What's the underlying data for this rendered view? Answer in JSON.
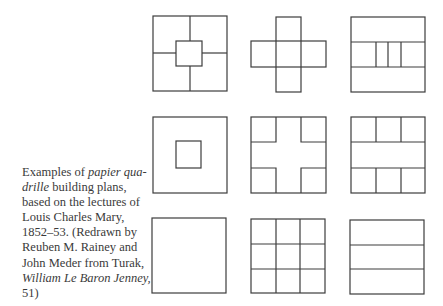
{
  "caption": {
    "lines": [
      {
        "pre": "Examples of ",
        "ital": "papier qua-",
        "post": ""
      },
      {
        "pre": "",
        "ital": "drille",
        "post": " building plans,"
      },
      {
        "pre": "based on the lectures of",
        "ital": "",
        "post": ""
      },
      {
        "pre": "Louis Charles Mary,",
        "ital": "",
        "post": ""
      },
      {
        "pre": "1852–53. (Redrawn by",
        "ital": "",
        "post": ""
      },
      {
        "pre": "Reuben M. Rainey and",
        "ital": "",
        "post": ""
      },
      {
        "pre": "John Meder  from Turak,",
        "ital": "",
        "post": ""
      },
      {
        "pre": "",
        "ital": "William Le Baron Jenney,",
        "post": ""
      },
      {
        "pre": "51)",
        "ital": "",
        "post": ""
      }
    ]
  },
  "figure": {
    "plans": [
      {
        "row": 1,
        "col": 1,
        "name": "square-with-central-square-and-four-arms"
      },
      {
        "row": 1,
        "col": 2,
        "name": "greek-cross-five-squares"
      },
      {
        "row": 1,
        "col": 3,
        "name": "three-bands-with-subdivided-middle"
      },
      {
        "row": 2,
        "col": 1,
        "name": "square-with-inner-square"
      },
      {
        "row": 2,
        "col": 2,
        "name": "square-with-four-corner-squares"
      },
      {
        "row": 2,
        "col": 3,
        "name": "three-bands-top-bottom-subdivided"
      },
      {
        "row": 3,
        "col": 1,
        "name": "plain-square"
      },
      {
        "row": 3,
        "col": 2,
        "name": "nine-square-grid"
      },
      {
        "row": 3,
        "col": 3,
        "name": "three-horizontal-bands"
      }
    ],
    "stroke_color": "#3c3c3c"
  }
}
